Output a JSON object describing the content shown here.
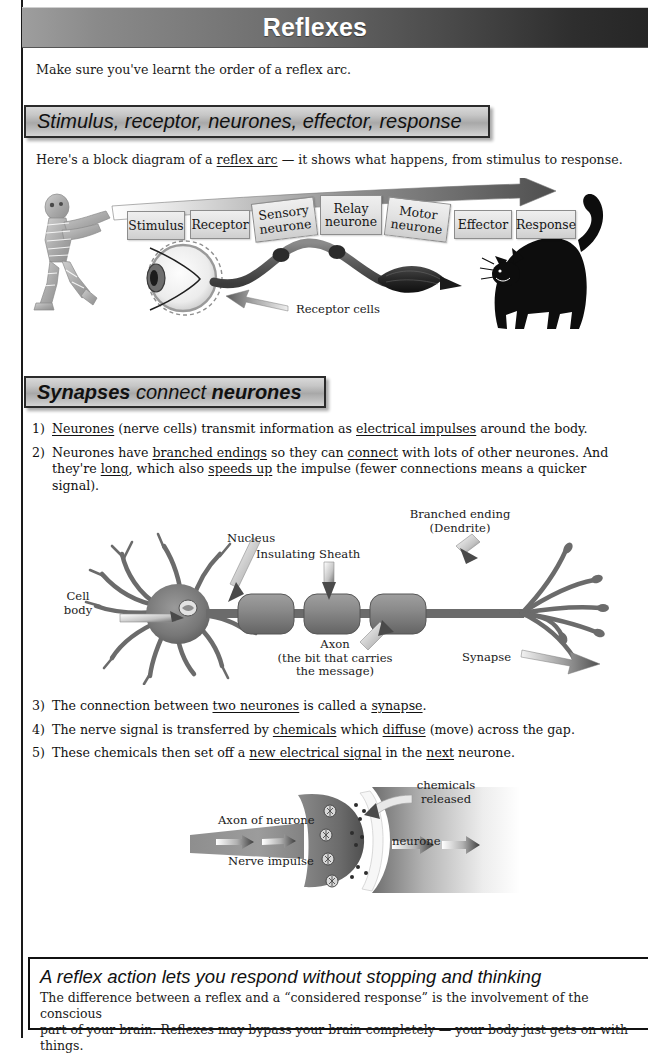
{
  "page": {
    "title": "Reflexes",
    "intro": "Make sure you've learnt the order of a reflex arc."
  },
  "sections": [
    {
      "heading_parts": [
        {
          "text": "Stimulus, receptor, neurones, effector, response",
          "weight": "regular"
        }
      ],
      "heading_plain": "Stimulus, receptor, neurones, effector, response",
      "intro_before": "Here's a block diagram of a ",
      "intro_underlined": "reflex arc",
      "intro_after": " — it shows what happens, from stimulus to response."
    },
    {
      "heading_parts": [
        {
          "text": "Synapses",
          "weight": "bold"
        },
        {
          "text": " connect ",
          "weight": "regular"
        },
        {
          "text": "neurones",
          "weight": "bold"
        }
      ],
      "heading_plain": "Synapses connect neurones"
    }
  ],
  "reflex_arc_diagram": {
    "blocks": [
      {
        "label": "Stimulus"
      },
      {
        "label": "Receptor"
      },
      {
        "label": "Sensory neurone"
      },
      {
        "label": "Relay neurone"
      },
      {
        "label": "Motor neurone"
      },
      {
        "label": "Effector"
      },
      {
        "label": "Response"
      }
    ],
    "callout": "Receptor cells",
    "figures": {
      "stimulus_figure": "mummy-figure",
      "receptor_figure": "eye",
      "effector_figure": "muscle",
      "response_figure": "cat"
    }
  },
  "list_a": [
    {
      "num": "1)",
      "runs": [
        {
          "t": "Neurones",
          "u": true
        },
        {
          "t": " (nerve cells) transmit information as ",
          "u": false
        },
        {
          "t": "electrical impulses",
          "u": true
        },
        {
          "t": " around the body.",
          "u": false
        }
      ]
    },
    {
      "num": "2)",
      "runs": [
        {
          "t": "Neurones have ",
          "u": false
        },
        {
          "t": "branched endings",
          "u": true
        },
        {
          "t": " so they can ",
          "u": false
        },
        {
          "t": "connect",
          "u": true
        },
        {
          "t": " with lots of other neurones. And they're ",
          "u": false
        },
        {
          "t": "long",
          "u": true
        },
        {
          "t": ", which also ",
          "u": false
        },
        {
          "t": "speeds up",
          "u": true
        },
        {
          "t": " the impulse (fewer connections means a quicker signal).",
          "u": false
        }
      ]
    }
  ],
  "list_b": [
    {
      "num": "3)",
      "runs": [
        {
          "t": "The connection between ",
          "u": false
        },
        {
          "t": "two neurones",
          "u": true
        },
        {
          "t": " is called a ",
          "u": false
        },
        {
          "t": "synapse",
          "u": true
        },
        {
          "t": ".",
          "u": false
        }
      ]
    },
    {
      "num": "4)",
      "runs": [
        {
          "t": "The nerve signal is transferred by ",
          "u": false
        },
        {
          "t": "chemicals",
          "u": true
        },
        {
          "t": " which ",
          "u": false
        },
        {
          "t": "diffuse",
          "u": true
        },
        {
          "t": " (move) across the gap.",
          "u": false
        }
      ]
    },
    {
      "num": "5)",
      "runs": [
        {
          "t": "These chemicals then set off a ",
          "u": false
        },
        {
          "t": "new electrical signal",
          "u": true
        },
        {
          "t": " in the ",
          "u": false
        },
        {
          "t": "next",
          "u": true
        },
        {
          "t": " neurone.",
          "u": false
        }
      ]
    }
  ],
  "neurone_diagram": {
    "labels": {
      "cell_body_1": "Cell",
      "cell_body_2": "body",
      "nucleus": "Nucleus",
      "insulating_sheath": "Insulating Sheath",
      "branched_ending_1": "Branched ending",
      "branched_ending_2": "(Dendrite)",
      "axon": "Axon",
      "axon_note_1": "(the bit that carries",
      "axon_note_2": "the message)",
      "synapse": "Synapse"
    }
  },
  "synapse_diagram": {
    "labels": {
      "axon_of_neurone": "Axon of neurone",
      "nerve_impulse": "Nerve impulse",
      "chemicals_1": "chemicals",
      "chemicals_2": "released",
      "neurone": "neurone"
    }
  },
  "footer": {
    "heading": "A reflex action lets you respond without stopping and thinking",
    "line1": "The difference between a reflex and a “considered response” is the involvement of the conscious",
    "line2": "part of your brain.  Reflexes may bypass your brain completely — your body just gets on with things."
  },
  "colors": {
    "title_bar_light": "#9e9e9e",
    "title_bar_dark": "#262626",
    "heading_bar_fill": "#bdbdbd",
    "heading_bar_border": "#2b2b2b",
    "block_fill": "#e3e3e3",
    "ink": "#1a1a1a"
  }
}
